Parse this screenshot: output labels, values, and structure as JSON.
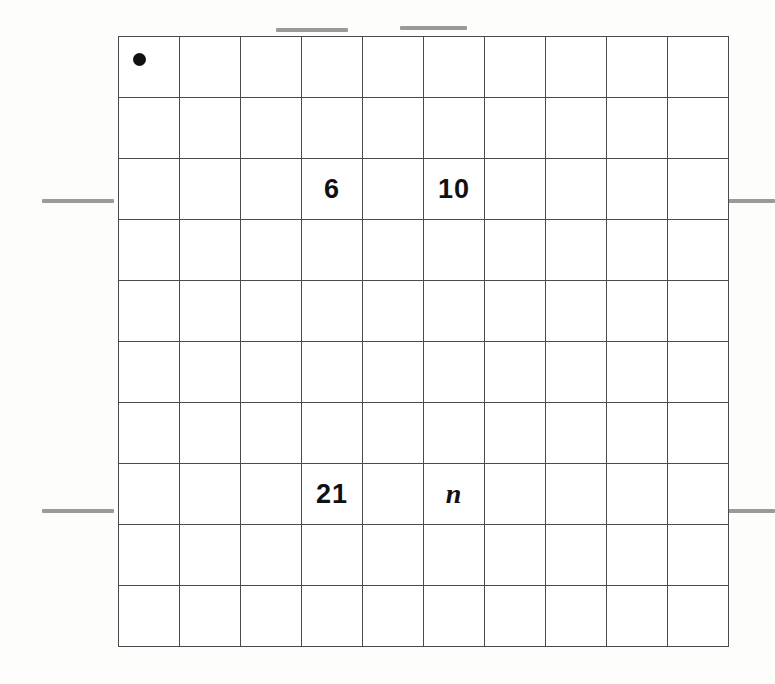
{
  "figure": {
    "type": "coordinate-grid-worksheet",
    "grid": {
      "rows": 10,
      "columns": 10,
      "shaded_columns": [
        1,
        4,
        6
      ],
      "shaded_rows": [
        1,
        3,
        8
      ],
      "origin_marker": "dot",
      "colors": {
        "line": "#4a4a4a",
        "cell_background": "#ffffff",
        "column_shade": "#d9d9d9",
        "row_shade": "#a9a9a9",
        "intersection_shade": "#a0a0a0",
        "origin_shade": "#9a9a9a",
        "text": "#111111",
        "blank_line": "#9a9a9a"
      }
    },
    "labels": [
      {
        "row": 3,
        "column": 4,
        "text": "6",
        "style": "upright"
      },
      {
        "row": 3,
        "column": 6,
        "text": "10",
        "style": "upright"
      },
      {
        "row": 8,
        "column": 4,
        "text": "21",
        "style": "upright"
      },
      {
        "row": 8,
        "column": 6,
        "text": "n",
        "style": "italic"
      }
    ],
    "answer_blanks": [
      {
        "name": "top-left-blank",
        "position": "top",
        "order": 1
      },
      {
        "name": "top-right-blank",
        "position": "top",
        "order": 2
      },
      {
        "name": "left-upper-blank",
        "position": "left",
        "order": 1
      },
      {
        "name": "left-lower-blank",
        "position": "left",
        "order": 2
      },
      {
        "name": "right-upper-blank",
        "position": "right",
        "order": 1
      },
      {
        "name": "right-lower-blank",
        "position": "right",
        "order": 2
      }
    ]
  }
}
